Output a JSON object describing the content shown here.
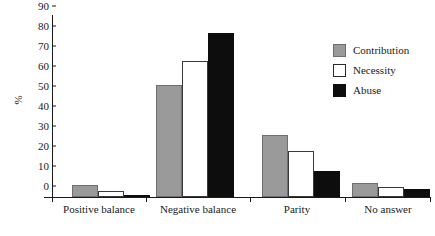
{
  "chart_data": {
    "type": "bar",
    "title": "",
    "xlabel": "",
    "ylabel": "%",
    "ylim": [
      0,
      90
    ],
    "yticks": [
      0,
      10,
      20,
      30,
      40,
      50,
      60,
      70,
      80,
      90
    ],
    "grid": false,
    "legend_position": "upper-right",
    "categories": [
      "Positive balance",
      "Negative balance",
      "Parity",
      "No answer"
    ],
    "series": [
      {
        "name": "Contribution",
        "color": "#9a9a9a",
        "values": [
          6,
          56,
          31,
          7
        ]
      },
      {
        "name": "Necessity",
        "color": "#ffffff",
        "values": [
          3,
          68,
          23,
          5
        ]
      },
      {
        "name": "Abuse",
        "color": "#0d0d0d",
        "values": [
          1,
          82,
          13,
          4
        ]
      }
    ]
  }
}
